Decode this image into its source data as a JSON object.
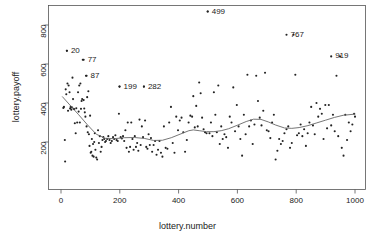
{
  "chart_data": {
    "type": "scatter",
    "title": "",
    "xlabel": "lottery.number",
    "ylabel": "lottery.payoff",
    "xlim": [
      -18,
      1015
    ],
    "ylim": [
      70,
      900
    ],
    "grid": false,
    "legend": null,
    "xticks": [
      0,
      200,
      400,
      600,
      800,
      1000
    ],
    "yticks": [
      200,
      400,
      600,
      800
    ],
    "xtick_labels": [
      "0",
      "200",
      "400",
      "600",
      "800",
      "1000"
    ],
    "ytick_labels": [
      "200",
      "400",
      "600",
      "800"
    ],
    "point_color": "#222222",
    "smooth_color": "#666666",
    "annotations": [
      {
        "label": "20",
        "x": 20,
        "y": 668
      },
      {
        "label": "77",
        "x": 77,
        "y": 622
      },
      {
        "label": "87",
        "x": 87,
        "y": 540
      },
      {
        "label": "199",
        "x": 199,
        "y": 484
      },
      {
        "label": "282",
        "x": 282,
        "y": 484
      },
      {
        "label": "499",
        "x": 499,
        "y": 869
      },
      {
        "label": "767",
        "x": 767,
        "y": 750
      },
      {
        "label": "919",
        "x": 919,
        "y": 639
      }
    ],
    "smooth_line": {
      "name": "loess",
      "x": [
        5,
        30,
        60,
        90,
        120,
        150,
        180,
        215,
        250,
        285,
        315,
        345,
        375,
        405,
        435,
        450,
        470,
        495,
        520,
        545,
        570,
        600,
        630,
        655,
        680,
        705,
        730,
        760,
        785,
        810,
        840,
        870,
        900,
        930,
        960,
        1000
      ],
      "y": [
        432,
        390,
        340,
        288,
        240,
        219,
        217,
        222,
        223,
        218,
        208,
        209,
        222,
        240,
        258,
        262,
        258,
        253,
        253,
        258,
        268,
        286,
        305,
        317,
        316,
        303,
        287,
        272,
        270,
        274,
        284,
        298,
        312,
        326,
        337,
        343
      ]
    },
    "points": {
      "x": [
        8,
        10,
        13,
        14,
        16,
        18,
        20,
        22,
        24,
        26,
        29,
        31,
        33,
        35,
        37,
        39,
        41,
        43,
        45,
        47,
        50,
        52,
        55,
        58,
        60,
        62,
        64,
        66,
        68,
        70,
        72,
        74,
        77,
        79,
        81,
        83,
        85,
        87,
        89,
        91,
        93,
        95,
        97,
        99,
        101,
        103,
        105,
        107,
        109,
        111,
        113,
        115,
        117,
        120,
        123,
        126,
        129,
        132,
        135,
        138,
        141,
        144,
        147,
        150,
        153,
        157,
        161,
        165,
        169,
        173,
        177,
        181,
        185,
        189,
        193,
        197,
        199,
        203,
        207,
        211,
        215,
        219,
        223,
        227,
        231,
        235,
        239,
        243,
        247,
        251,
        255,
        259,
        263,
        267,
        271,
        275,
        279,
        282,
        286,
        290,
        294,
        298,
        302,
        306,
        310,
        315,
        320,
        325,
        330,
        335,
        340,
        345,
        350,
        356,
        362,
        368,
        374,
        380,
        386,
        392,
        398,
        404,
        410,
        416,
        422,
        428,
        434,
        440,
        446,
        450,
        455,
        460,
        465,
        470,
        475,
        480,
        485,
        490,
        495,
        499,
        505,
        510,
        515,
        520,
        525,
        530,
        535,
        540,
        545,
        550,
        556,
        562,
        568,
        574,
        580,
        586,
        592,
        598,
        604,
        610,
        616,
        622,
        628,
        634,
        640,
        646,
        652,
        658,
        664,
        670,
        676,
        682,
        688,
        694,
        700,
        706,
        712,
        718,
        724,
        730,
        736,
        742,
        748,
        754,
        760,
        767,
        773,
        779,
        785,
        791,
        797,
        803,
        809,
        815,
        821,
        827,
        833,
        839,
        845,
        851,
        857,
        863,
        869,
        875,
        881,
        887,
        893,
        899,
        905,
        911,
        919,
        925,
        931,
        937,
        943,
        949,
        955,
        961,
        967,
        973,
        979,
        985,
        991,
        997,
        1000
      ],
      "y": [
        375,
        380,
        210,
        100,
        470,
        445,
        668,
        500,
        360,
        490,
        455,
        372,
        380,
        366,
        378,
        530,
        420,
        370,
        368,
        296,
        245,
        373,
        300,
        455,
        356,
        490,
        300,
        500,
        370,
        410,
        420,
        622,
        415,
        372,
        352,
        330,
        540,
        280,
        430,
        250,
        460,
        240,
        180,
        335,
        145,
        150,
        215,
        130,
        190,
        125,
        200,
        245,
        160,
        120,
        110,
        260,
        195,
        230,
        150,
        175,
        210,
        225,
        215,
        200,
        205,
        215,
        230,
        210,
        195,
        205,
        225,
        215,
        235,
        210,
        205,
        345,
        484,
        225,
        218,
        230,
        205,
        260,
        170,
        300,
        150,
        175,
        300,
        215,
        160,
        230,
        175,
        195,
        155,
        315,
        185,
        280,
        225,
        484,
        310,
        175,
        165,
        240,
        185,
        220,
        150,
        185,
        205,
        135,
        160,
        205,
        145,
        125,
        280,
        170,
        165,
        300,
        380,
        195,
        145,
        330,
        260,
        310,
        325,
        250,
        150,
        210,
        300,
        335,
        330,
        435,
        275,
        385,
        280,
        505,
        450,
        325,
        265,
        250,
        245,
        869,
        245,
        300,
        230,
        455,
        340,
        250,
        490,
        190,
        280,
        215,
        240,
        225,
        170,
        330,
        300,
        480,
        255,
        390,
        280,
        215,
        130,
        340,
        240,
        545,
        280,
        310,
        190,
        290,
        540,
        410,
        325,
        285,
        360,
        555,
        260,
        255,
        220,
        300,
        340,
        110,
        155,
        215,
        190,
        205,
        245,
        265,
        280,
        170,
        195,
        750,
        545,
        235,
        245,
        290,
        230,
        265,
        180,
        245,
        300,
        380,
        285,
        240,
        400,
        330,
        370,
        345,
        215,
        390,
        270,
        390,
        285,
        340,
        255,
        540,
        230,
        639,
        170,
        130,
        340,
        210,
        300,
        255,
        290,
        345,
        330,
        370,
        505,
        450,
        290,
        240
      ]
    }
  }
}
